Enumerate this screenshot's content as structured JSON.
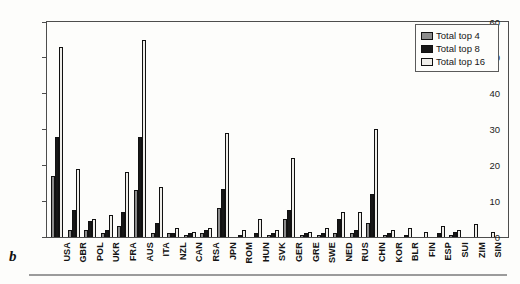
{
  "figure_label": "b",
  "axes": {
    "y_tick_labels": [
      "0",
      "10",
      "20",
      "30",
      "40",
      "50",
      "60"
    ]
  },
  "legend": {
    "entries": [
      "Total top 4",
      "Total top 8",
      "Total top 16"
    ]
  },
  "colors": {
    "top4": "#8c8c8c",
    "top8": "#171717",
    "top16": "#efeeea",
    "frame": "#4d4d4d"
  },
  "chart_data": {
    "type": "bar",
    "title": "",
    "xlabel": "",
    "ylabel": "",
    "ylim": [
      0,
      60
    ],
    "yticks": [
      0,
      10,
      20,
      30,
      40,
      50,
      60
    ],
    "grid": false,
    "legend_position": "top-right",
    "categories": [
      "USA",
      "GBR",
      "POL",
      "UKR",
      "FRA",
      "AUS",
      "ITA",
      "NZL",
      "CAN",
      "RSA",
      "JPN",
      "ROM",
      "HUN",
      "SVK",
      "GER",
      "GRE",
      "SWE",
      "NED",
      "RUS",
      "CHN",
      "KOR",
      "BLR",
      "FIN",
      "ESP",
      "SUI",
      "ZIM",
      "SIN"
    ],
    "series": [
      {
        "name": "Total top 4",
        "color": "#8c8c8c",
        "values": [
          17,
          2,
          2,
          1,
          3,
          13,
          1,
          1,
          0.5,
          1,
          8,
          0,
          0,
          0.5,
          5,
          0.5,
          0.5,
          1,
          1,
          4,
          0.5,
          0,
          0,
          0,
          0.5,
          0,
          0
        ]
      },
      {
        "name": "Total top 8",
        "color": "#171717",
        "values": [
          28,
          7.5,
          4.5,
          2,
          7,
          28,
          4,
          1,
          1,
          2,
          13.5,
          0.5,
          1,
          1,
          7.5,
          1,
          1,
          5,
          2,
          12,
          1,
          0.5,
          0,
          1,
          1.5,
          0,
          0
        ]
      },
      {
        "name": "Total top 16",
        "color": "#efeeea",
        "values": [
          53,
          19,
          5,
          6,
          18,
          55,
          14,
          2.5,
          1.5,
          2.5,
          29,
          2,
          5,
          2,
          22,
          1.5,
          2.5,
          7,
          7,
          30,
          2,
          2.5,
          1.5,
          3,
          2,
          3.5,
          1.5
        ]
      }
    ]
  }
}
